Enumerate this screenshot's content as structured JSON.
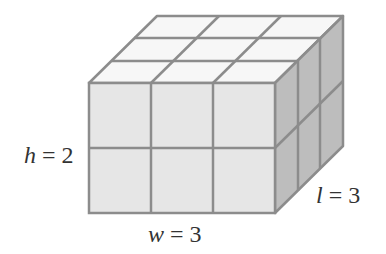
{
  "figure": {
    "type": "rectangular prism built from unit cubes",
    "dimensions": {
      "w": 3,
      "h": 2,
      "l": 3
    },
    "unit_cube_count": 18
  },
  "labels": {
    "height": {
      "var": "h",
      "eq": " = ",
      "value": "2"
    },
    "width": {
      "var": "w",
      "eq": " = ",
      "value": "3"
    },
    "length": {
      "var": "l",
      "eq": " = ",
      "value": "3"
    }
  },
  "colors": {
    "front_face": "#e6e6e6",
    "top_face": "#f7f7f7",
    "side_face": "#bdbdbd",
    "edge": "#8c8c8c",
    "text": "#333333"
  }
}
